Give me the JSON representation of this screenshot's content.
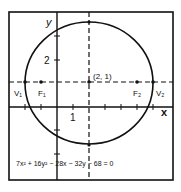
{
  "diagram": {
    "type": "ellipse-graph",
    "equation": "7x² + 16y² − 28x − 32y − 68 = 0",
    "center_label": "(2, 1)",
    "axis_labels": {
      "x": "x",
      "y": "y"
    },
    "tick_labels": {
      "x": "1",
      "y": "2"
    },
    "points": {
      "v1": "V₁",
      "f1": "F₁",
      "f2": "F₂",
      "v2": "V₂"
    },
    "colors": {
      "stroke": "#111111",
      "background": "#ffffff"
    }
  }
}
